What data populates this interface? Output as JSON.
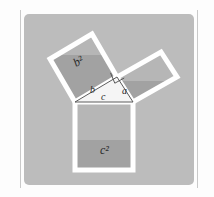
{
  "figure": {
    "panel": {
      "background_color": "#bcbcbc",
      "page_color": "#fdfdfd",
      "edge_rule_color": "#c9c9c9"
    },
    "colors": {
      "square_fill_light": "#b4b4b4",
      "square_fill_dark": "#a2a2a2",
      "square_outline": "#ffffff",
      "triangle_fill": "#f4f4f4",
      "triangle_stroke": "#4a4a4a",
      "label_color": "#2b2b2b"
    },
    "labels": {
      "square_b": "b²",
      "square_c": "c²",
      "leg_a": "a",
      "leg_b": "b",
      "hypotenuse_c": "c"
    },
    "elements": {
      "square_on_b_name": "square-b-squared",
      "square_on_a_name": "square-a-squared",
      "square_on_c_name": "square-c-squared",
      "triangle_name": "right-triangle",
      "right_angle_marker_name": "right-angle-marker"
    },
    "geometry": {
      "triangle": {
        "left_vertex": [
          75,
          102
        ],
        "right_vertex": [
          133,
          102
        ],
        "apex": [
          117,
          77
        ]
      },
      "square_b_points": "75,102 117,77 92,34 50,59",
      "square_a_points": "117,77 133,102 177,77 161,52",
      "square_c_points": "75,102 133,102 133,170 75,170",
      "right_angle_marker": "110,73 117,77 113,84"
    }
  }
}
